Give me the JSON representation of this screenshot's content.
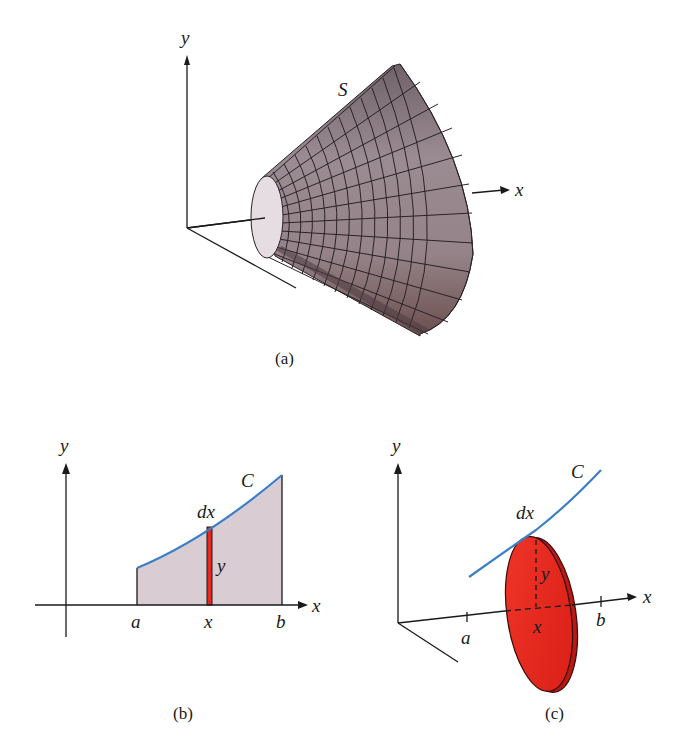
{
  "figure": {
    "panels": [
      {
        "id": "a",
        "caption": "(a)",
        "description": "Surface of revolution S about the x-axis",
        "labels": {
          "y_axis": "y",
          "x_axis": "x",
          "surface": "S"
        }
      },
      {
        "id": "b",
        "caption": "(b)",
        "description": "Region under curve C from a to b with thin strip of width dx and height y",
        "labels": {
          "y_axis": "y",
          "x_axis": "x",
          "curve": "C",
          "strip_width": "dx",
          "strip_height": "y",
          "tick_a": "a",
          "tick_x": "x",
          "tick_b": "b"
        }
      },
      {
        "id": "c",
        "caption": "(c)",
        "description": "Disk of radius y and thickness dx generated by rotating the strip about the x-axis",
        "labels": {
          "y_axis": "y",
          "x_axis": "x",
          "curve": "C",
          "disk_thickness": "dx",
          "disk_radius": "y",
          "tick_a": "a",
          "tick_x": "x",
          "tick_b": "b"
        }
      }
    ],
    "colors": {
      "surface_fill": "#8f8187",
      "surface_dark": "#4a3a3f",
      "surface_end_cap": "#e6dde2",
      "region_fill": "#d9ccd3",
      "curve": "#3d7fc4",
      "strip_disk": "#e8271e",
      "axis": "#1a1a1a"
    }
  }
}
